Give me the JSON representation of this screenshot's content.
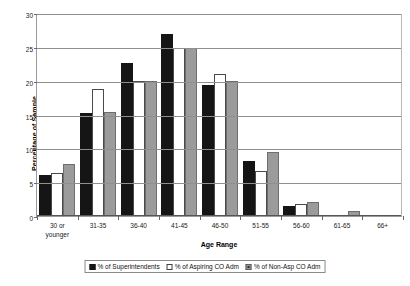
{
  "chart_data": {
    "type": "bar",
    "title": "",
    "xlabel": "Age Range",
    "ylabel": "Percentage of Sample",
    "ylim": [
      0,
      30
    ],
    "yticks": [
      0,
      5,
      10,
      15,
      20,
      25,
      30
    ],
    "grid": true,
    "legend_position": "bottom",
    "categories": [
      "30 or\nyounger",
      "31-35",
      "36-40",
      "41-45",
      "46-50",
      "51-55",
      "56-60",
      "61-65",
      "66+"
    ],
    "series": [
      {
        "name": "% of Superintendents",
        "color": "#151515",
        "values": [
          6.0,
          15.2,
          22.6,
          26.9,
          19.3,
          8.2,
          1.5,
          0,
          0
        ]
      },
      {
        "name": "% of Aspiring CO Adm",
        "color": "#ffffff",
        "values": [
          6.4,
          18.8,
          19.9,
          24.9,
          21.0,
          6.6,
          1.8,
          0,
          0
        ]
      },
      {
        "name": "% of Non-Asp CO Adm",
        "color": "#9b9b9b",
        "values": [
          7.7,
          15.3,
          19.9,
          24.9,
          20.0,
          9.5,
          2.0,
          0.7,
          0
        ]
      }
    ]
  },
  "axis": {
    "y_title": "Percentage of Sample",
    "x_title": "Age Range",
    "y_tick_labels": [
      "0",
      "5",
      "10",
      "15",
      "20",
      "25",
      "30"
    ]
  },
  "legend": {
    "entries": [
      "% of Superintendents",
      "% of Aspiring CO Adm",
      "% of Non-Asp CO Adm"
    ]
  }
}
